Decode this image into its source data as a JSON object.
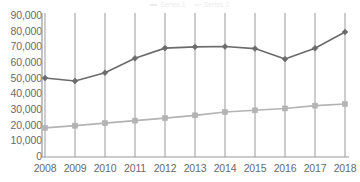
{
  "chart_data": {
    "type": "line",
    "title": "",
    "subtitle": "",
    "xlabel": "",
    "ylabel": "",
    "x": [
      2008,
      2009,
      2010,
      2011,
      2012,
      2013,
      2014,
      2015,
      2016,
      2017,
      2018
    ],
    "categories": [
      "2008",
      "2009",
      "2010",
      "2011",
      "2012",
      "2013",
      "2014",
      "2015",
      "2016",
      "2017",
      "2018"
    ],
    "ylim": [
      0,
      90000
    ],
    "yticks": [
      0,
      10000,
      20000,
      30000,
      40000,
      50000,
      60000,
      70000,
      80000,
      90000
    ],
    "ytick_labels": [
      "0",
      "10,000",
      "20,000",
      "30,000",
      "40,000",
      "50,000",
      "60,000",
      "70,000",
      "80,000",
      "90,000"
    ],
    "grid": "vertical",
    "legend_position": "top",
    "series": [
      {
        "name": "Series 1",
        "color": "#6b6b6b",
        "marker": "diamond",
        "values": [
          50400,
          48500,
          53800,
          63000,
          69500,
          70300,
          70500,
          69200,
          62500,
          69400,
          79800
        ]
      },
      {
        "name": "Series 2",
        "color": "#b3b3b3",
        "marker": "square",
        "values": [
          18600,
          20000,
          21600,
          23200,
          24800,
          26600,
          28700,
          29800,
          31000,
          32800,
          33800
        ]
      }
    ]
  },
  "axes": {
    "axis_line_color": "#9a9a9a",
    "gridline_color": "#8f8f8f",
    "tick_label_color": "#6a6a6a"
  },
  "legend": {
    "entries": [
      {
        "label": "Series 1",
        "color": "#6b6b6b"
      },
      {
        "label": "Series 2",
        "color": "#b3b3b3"
      }
    ]
  }
}
